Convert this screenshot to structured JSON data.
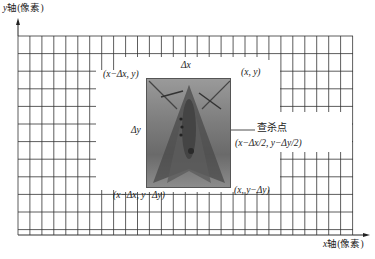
{
  "axes": {
    "y_label_var": "y",
    "y_label_text": "轴(像素)",
    "x_label_var": "x",
    "x_label_text": "轴(像素)"
  },
  "labels": {
    "delta_x": "Δx",
    "delta_y": "Δy",
    "top_left": "(x−Δx, y)",
    "top_right": "(x, y)",
    "bottom_left": "(x−Δx, y−Δy)",
    "bottom_right": "(x, y−Δy)",
    "kill_point_title": "查杀点",
    "kill_point_coord": "(x−Δx/2, y−Δy/2)"
  },
  "image": {
    "subject": "moth-photo",
    "color": "#7a7a7a"
  },
  "grid": {
    "left": 18,
    "right": 353,
    "top": 36,
    "bottom": 235,
    "col_spacing": 11.95,
    "row_spacing": 17.6,
    "line_color": "#333333"
  }
}
